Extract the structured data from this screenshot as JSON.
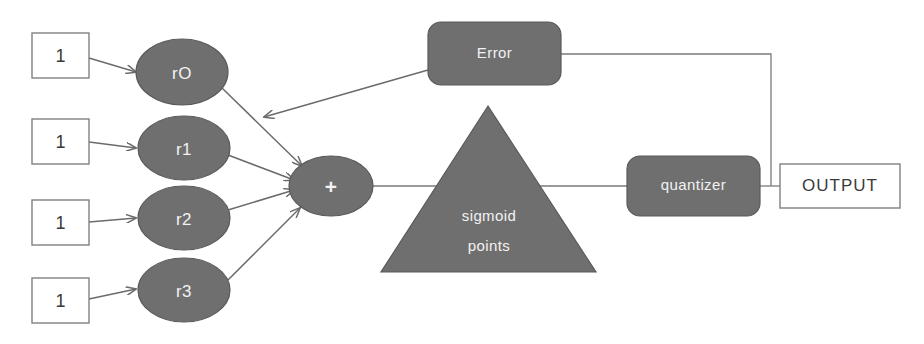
{
  "diagram": {
    "colors": {
      "shape_fill": "#6f6f6f",
      "shape_stroke": "#5a5a5a",
      "shape_text": "#f2f2f2",
      "box_text": "#3a3a3a",
      "line": "#6b6b6b",
      "background": "#ffffff"
    },
    "inputs": [
      {
        "name": "input-1",
        "value": "1"
      },
      {
        "name": "input-2",
        "value": "1"
      },
      {
        "name": "input-3",
        "value": "1"
      },
      {
        "name": "input-4",
        "value": "1"
      }
    ],
    "neurons": [
      {
        "name": "neuron-r0",
        "label": "rO"
      },
      {
        "name": "neuron-r1",
        "label": "r1"
      },
      {
        "name": "neuron-r2",
        "label": "r2"
      },
      {
        "name": "neuron-r3",
        "label": "r3"
      }
    ],
    "summing_node": {
      "label": "+"
    },
    "error_block": {
      "label": "Error"
    },
    "activation_block": {
      "line1": "sigmoid",
      "line2": "points"
    },
    "quantizer_block": {
      "label": "quantizer"
    },
    "output_block": {
      "label": "OUTPUT"
    }
  }
}
